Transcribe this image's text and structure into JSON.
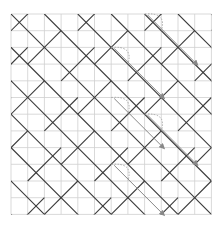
{
  "figure": {
    "grid_columns": 12,
    "grid_rows": 12,
    "colors": {
      "grid": "#cfcfcf",
      "tile_edge": "#3a3a3a",
      "arrow": "#888888",
      "dotted_arc": "#aaaaaa"
    },
    "annotations": [
      {
        "from": [
          6,
          2
        ],
        "to": [
          9,
          5
        ]
      },
      {
        "from": [
          6,
          2
        ],
        "to": [
          9,
          5
        ]
      },
      {
        "from": [
          6,
          8
        ],
        "to": [
          9,
          11
        ]
      }
    ]
  }
}
